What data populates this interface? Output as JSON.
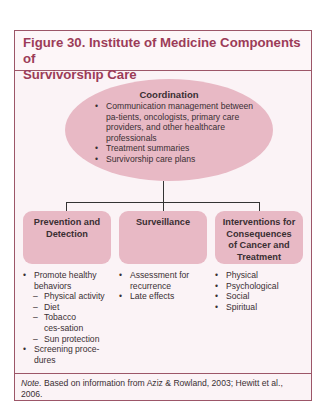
{
  "figure": {
    "title": "Figure 30. Institute of Medicine Components of Survivorship Care",
    "title_line1": "Figure 30. Institute of Medicine Components of",
    "title_line2": "Survivorship Care"
  },
  "colors": {
    "border": "#9c5668",
    "title_text": "#9c3c58",
    "shape_fill": "#e8b9c5",
    "background": "#fbf3f6"
  },
  "coordination": {
    "title": "Coordination",
    "items": [
      "Communication management between pa-tients, oncologists, primary care providers, and other healthcare professionals",
      "Treatment summaries",
      "Survivorship care plans"
    ]
  },
  "components": [
    {
      "title": "Prevention and Detection",
      "items": [
        {
          "type": "bullet",
          "text": "Promote healthy behaviors"
        },
        {
          "type": "dash",
          "text": "Physical activity"
        },
        {
          "type": "dash",
          "text": "Diet"
        },
        {
          "type": "dash",
          "text": "Tobacco ces-sation"
        },
        {
          "type": "dash",
          "text": "Sun protection"
        },
        {
          "type": "bullet",
          "text": "Screening proce-dures"
        }
      ]
    },
    {
      "title": "Surveillance",
      "items": [
        {
          "type": "bullet",
          "text": "Assessment for recurrence"
        },
        {
          "type": "bullet",
          "text": "Late effects"
        }
      ]
    },
    {
      "title": "Interventions for Consequences of Cancer and Treatment",
      "items": [
        {
          "type": "bullet",
          "text": "Physical"
        },
        {
          "type": "bullet",
          "text": "Psychological"
        },
        {
          "type": "bullet",
          "text": "Social"
        },
        {
          "type": "bullet",
          "text": "Spiritual"
        }
      ]
    }
  ],
  "note": {
    "label": "Note.",
    "text": " Based on information from Aziz & Rowland, 2003; Hewitt et al., 2006."
  }
}
